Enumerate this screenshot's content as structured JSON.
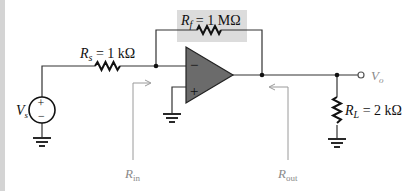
{
  "diagram": {
    "type": "inverting-op-amp-circuit",
    "colors": {
      "wire": "#333333",
      "opamp_fill": "#6b6b6b",
      "feedback_highlight": "#dcdcdc",
      "annotation": "#9a9a9a",
      "left_strip": "#d4d4d4"
    },
    "components": {
      "source": {
        "name": "V",
        "sub": "s",
        "plus": "+",
        "minus": "−"
      },
      "rs": {
        "name": "R",
        "sub": "s",
        "value": " = 1 kΩ"
      },
      "rf": {
        "name": "R",
        "sub": "f",
        "value": " = 1 MΩ"
      },
      "rl": {
        "name": "R",
        "sub": "L",
        "value": " = 2 kΩ"
      },
      "opamp": {
        "inverting": "−",
        "noninverting": "+"
      },
      "output": {
        "name": "V",
        "sub": "o"
      }
    },
    "annotations": {
      "rin": {
        "name": "R",
        "sub": "in"
      },
      "rout": {
        "name": "R",
        "sub": "out"
      }
    }
  }
}
